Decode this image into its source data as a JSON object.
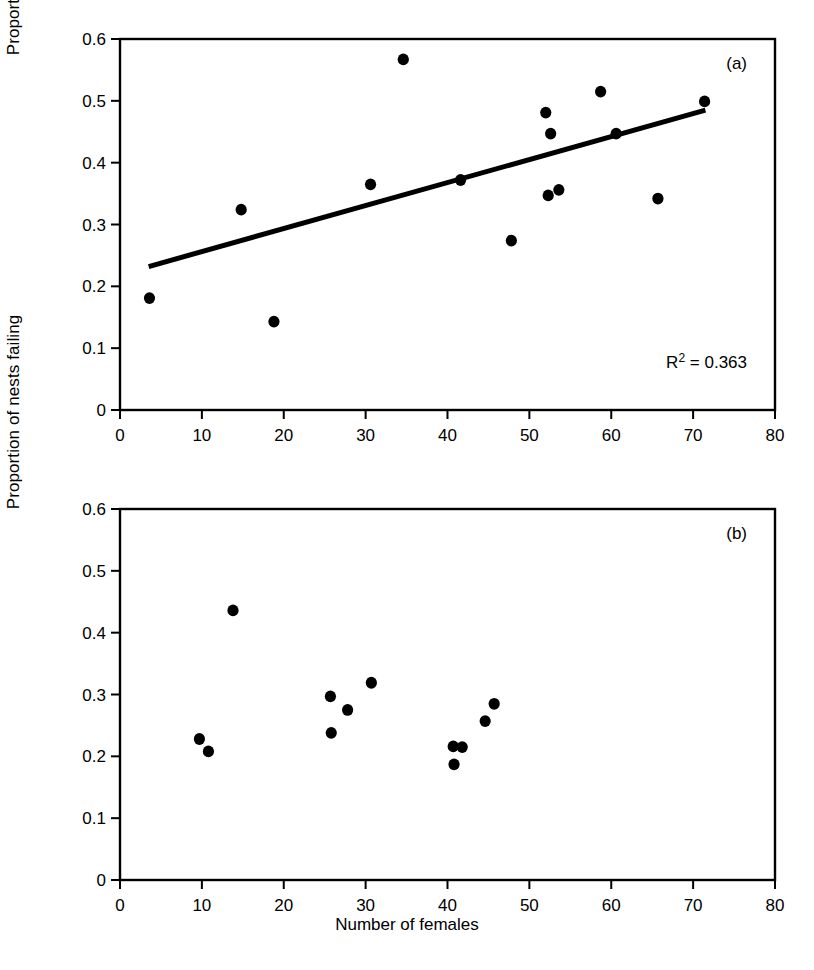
{
  "figure": {
    "xlabel": "Number of females",
    "ylabel": "Proportion of nests failing"
  },
  "panels": {
    "a": {
      "tag": "(a)",
      "annotation": "R² = 0.363",
      "r2_label": "R",
      "r2_exponent": "2",
      "r2_value": "= 0.363"
    },
    "b": {
      "tag": "(b)"
    }
  },
  "axes": {
    "x_ticks": [
      "0",
      "10",
      "20",
      "30",
      "40",
      "50",
      "60",
      "70",
      "80"
    ],
    "y_ticks": [
      "0",
      "0.1",
      "0.2",
      "0.3",
      "0.4",
      "0.5",
      "0.6"
    ]
  },
  "chart_data": [
    {
      "type": "scatter",
      "panel": "(a)",
      "title": "",
      "xlabel": "Number of females",
      "ylabel": "Proportion of nests failing",
      "xlim": [
        0,
        80
      ],
      "ylim": [
        0,
        0.6
      ],
      "xticks": [
        0,
        10,
        20,
        30,
        40,
        50,
        60,
        70,
        80
      ],
      "yticks": [
        0,
        0.1,
        0.2,
        0.3,
        0.4,
        0.5,
        0.6
      ],
      "grid": false,
      "legend": "none",
      "annotations": [
        {
          "text": "(a)",
          "position": "top-right"
        },
        {
          "text": "R² = 0.363",
          "position": "bottom-right"
        }
      ],
      "points": [
        {
          "x": 3.6,
          "y": 0.181
        },
        {
          "x": 14.8,
          "y": 0.324
        },
        {
          "x": 18.8,
          "y": 0.143
        },
        {
          "x": 30.6,
          "y": 0.365
        },
        {
          "x": 34.6,
          "y": 0.567
        },
        {
          "x": 41.6,
          "y": 0.372
        },
        {
          "x": 47.8,
          "y": 0.274
        },
        {
          "x": 52.0,
          "y": 0.481
        },
        {
          "x": 52.3,
          "y": 0.347
        },
        {
          "x": 52.6,
          "y": 0.447
        },
        {
          "x": 53.6,
          "y": 0.356
        },
        {
          "x": 58.7,
          "y": 0.515
        },
        {
          "x": 60.6,
          "y": 0.447
        },
        {
          "x": 65.7,
          "y": 0.342
        },
        {
          "x": 71.4,
          "y": 0.499
        }
      ],
      "trendline": {
        "x_start": 3.5,
        "y_start": 0.232,
        "x_end": 71.5,
        "y_end": 0.485,
        "r_squared": 0.363
      }
    },
    {
      "type": "scatter",
      "panel": "(b)",
      "title": "",
      "xlabel": "Number of females",
      "ylabel": "Proportion of nests failing",
      "xlim": [
        0,
        80
      ],
      "ylim": [
        0,
        0.6
      ],
      "xticks": [
        0,
        10,
        20,
        30,
        40,
        50,
        60,
        70,
        80
      ],
      "yticks": [
        0,
        0.1,
        0.2,
        0.3,
        0.4,
        0.5,
        0.6
      ],
      "grid": false,
      "legend": "none",
      "annotations": [
        {
          "text": "(b)",
          "position": "top-right"
        }
      ],
      "points": [
        {
          "x": 9.7,
          "y": 0.228
        },
        {
          "x": 10.8,
          "y": 0.208
        },
        {
          "x": 13.8,
          "y": 0.436
        },
        {
          "x": 25.7,
          "y": 0.297
        },
        {
          "x": 25.8,
          "y": 0.238
        },
        {
          "x": 27.8,
          "y": 0.275
        },
        {
          "x": 30.7,
          "y": 0.319
        },
        {
          "x": 40.7,
          "y": 0.216
        },
        {
          "x": 40.8,
          "y": 0.187
        },
        {
          "x": 41.8,
          "y": 0.215
        },
        {
          "x": 44.6,
          "y": 0.257
        },
        {
          "x": 45.7,
          "y": 0.285
        }
      ],
      "trendline": null
    }
  ]
}
